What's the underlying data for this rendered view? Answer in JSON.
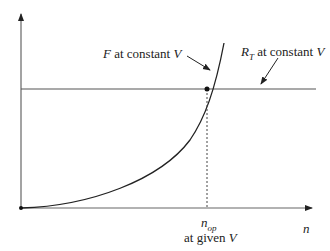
{
  "diagram": {
    "curve_label": {
      "var": "F",
      "text": " at constant ",
      "var2": "V"
    },
    "line_label": {
      "var": "R",
      "sub": "T",
      "text": " at constant ",
      "var2": "V"
    },
    "xaxis_label": "n",
    "op_label": {
      "var": "n",
      "sub": "op"
    },
    "op_caption": {
      "text": "at given ",
      "var": "V"
    },
    "colors": {
      "line": "#555555",
      "curve": "#222222"
    }
  }
}
